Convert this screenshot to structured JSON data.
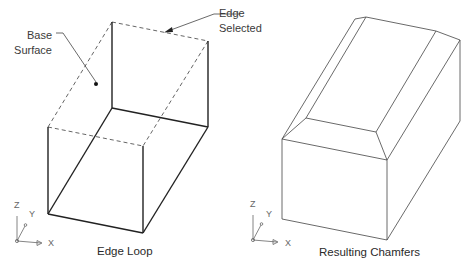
{
  "left_figure": {
    "caption": "Edge Loop",
    "callouts": {
      "base_surface": [
        "Base",
        "Surface"
      ],
      "edge_selected": [
        "Edge",
        "Selected"
      ]
    },
    "axes": {
      "z": "Z",
      "y": "Y",
      "x": "X"
    }
  },
  "right_figure": {
    "caption": "Resulting Chamfers",
    "axes": {
      "z": "Z",
      "y": "Y",
      "x": "X"
    }
  },
  "colors": {
    "line": "#222222",
    "thin_line": "#555555",
    "text": "#333333"
  }
}
